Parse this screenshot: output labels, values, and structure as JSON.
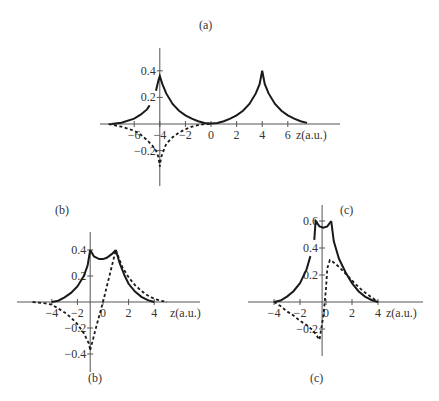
{
  "figure": {
    "panel_labels_top": [
      "(a)",
      "(b)",
      "(c)"
    ],
    "panel_labels_bottom": [
      "(b)",
      "(c)"
    ],
    "caption_fragment": ""
  },
  "chart_data": [
    {
      "id": "a",
      "type": "line",
      "title": "(a)",
      "xlabel": "z(a.u.)",
      "ylabel": "",
      "xlim": [
        -8,
        8
      ],
      "ylim": [
        -0.32,
        0.45
      ],
      "xticks": [
        -6,
        -4,
        -2,
        0,
        2,
        4,
        6
      ],
      "xtick_labels": [
        "-6",
        "-4",
        "-2",
        "0",
        "2",
        "4",
        "6"
      ],
      "yticks": [
        0.4,
        0.2,
        -0.2
      ],
      "ytick_labels": [
        "0.4",
        "0.2",
        "-0.2"
      ],
      "yaxis_at_x": -4,
      "grid": false,
      "legend": null,
      "series": [
        {
          "name": "solid",
          "style": "solid",
          "segments": [
            {
              "x": [
                -7.8,
                -7,
                -6,
                -5.5,
                -5,
                -4.8
              ],
              "y": [
                0.0,
                0.01,
                0.04,
                0.07,
                0.11,
                0.14
              ]
            },
            {
              "x": [
                -4.3,
                -4.1,
                -4,
                -3.8,
                -3.5,
                -3,
                -2.5,
                -2,
                -1.5,
                -1,
                -0.5,
                0,
                0.5,
                1,
                1.5,
                2,
                2.5,
                3,
                3.5,
                3.8,
                4,
                4.2,
                4.5,
                5,
                5.5,
                6,
                6.5,
                7,
                7.5
              ],
              "y": [
                0.25,
                0.33,
                0.36,
                0.3,
                0.23,
                0.15,
                0.1,
                0.065,
                0.04,
                0.02,
                0.008,
                0.003,
                0.008,
                0.02,
                0.04,
                0.065,
                0.1,
                0.15,
                0.23,
                0.3,
                0.4,
                0.3,
                0.23,
                0.15,
                0.1,
                0.065,
                0.04,
                0.02,
                0.008
              ]
            }
          ]
        },
        {
          "name": "dashed",
          "style": "dashed",
          "segments": [
            {
              "x": [
                -8,
                -7,
                -6,
                -5.5,
                -5,
                -4.6,
                -4.3,
                -4.1,
                -4,
                -3.9,
                -3.7,
                -3.5,
                -3,
                -2.5,
                -2,
                -1.5,
                -1,
                -0.5,
                0
              ],
              "y": [
                0.0,
                -0.02,
                -0.05,
                -0.08,
                -0.12,
                -0.16,
                -0.2,
                -0.25,
                -0.32,
                -0.25,
                -0.2,
                -0.15,
                -0.1,
                -0.065,
                -0.04,
                -0.02,
                -0.008,
                0.0,
                0.0
              ]
            }
          ]
        }
      ]
    },
    {
      "id": "b",
      "type": "line",
      "title": "(b)",
      "xlabel": "z(a.u.)",
      "ylabel": "",
      "xlim": [
        -5.5,
        5.5
      ],
      "ylim": [
        -0.45,
        0.45
      ],
      "xticks": [
        -4,
        -2,
        0,
        2,
        4
      ],
      "xtick_labels": [
        "-4",
        "-2",
        "0",
        "2",
        "4"
      ],
      "yticks": [
        0.4,
        0.2,
        -0.2,
        -0.4
      ],
      "ytick_labels": [
        "0.4",
        "0.2",
        "-0.2",
        "-0.4"
      ],
      "yaxis_at_x": -1,
      "grid": false,
      "legend": null,
      "series": [
        {
          "name": "solid",
          "style": "solid",
          "segments": [
            {
              "x": [
                -4,
                -3.5,
                -3,
                -2.5,
                -2,
                -1.5,
                -1.2,
                -1
              ],
              "y": [
                0.0,
                0.01,
                0.035,
                0.07,
                0.12,
                0.2,
                0.28,
                0.4
              ]
            },
            {
              "x": [
                -1,
                -0.7,
                -0.3,
                0,
                0.3,
                0.7,
                1
              ],
              "y": [
                0.4,
                0.35,
                0.33,
                0.33,
                0.34,
                0.37,
                0.4
              ]
            },
            {
              "x": [
                1,
                1.3,
                1.7,
                2,
                2.5,
                3,
                3.5,
                4
              ],
              "y": [
                0.4,
                0.3,
                0.2,
                0.14,
                0.08,
                0.04,
                0.015,
                0.0
              ]
            }
          ]
        },
        {
          "name": "dashed",
          "style": "dashed",
          "segments": [
            {
              "x": [
                -5.5,
                -4.5,
                -4,
                -3.5,
                -3,
                -2.5,
                -2,
                -1.5,
                -1.1,
                -1
              ],
              "y": [
                0.0,
                -0.01,
                -0.02,
                -0.05,
                -0.08,
                -0.12,
                -0.17,
                -0.24,
                -0.32,
                -0.37
              ]
            },
            {
              "x": [
                -1,
                -0.5,
                0,
                0.5,
                1
              ],
              "y": [
                -0.37,
                -0.18,
                0.0,
                0.2,
                0.4
              ]
            },
            {
              "x": [
                1,
                1.5,
                2,
                2.5,
                3,
                3.5,
                4,
                4.5,
                5
              ],
              "y": [
                0.4,
                0.27,
                0.19,
                0.13,
                0.085,
                0.05,
                0.025,
                0.01,
                0.0
              ]
            }
          ]
        }
      ]
    },
    {
      "id": "c",
      "type": "line",
      "title": "(c)",
      "xlabel": "z(a.u.)",
      "ylabel": "",
      "xlim": [
        -5,
        5
      ],
      "ylim": [
        -0.35,
        0.65
      ],
      "xticks": [
        -4,
        -2,
        0,
        2,
        4
      ],
      "xtick_labels": [
        "-4",
        "-2",
        "0",
        "2",
        "4"
      ],
      "yticks": [
        0.6,
        0.4,
        0.2,
        -0.2
      ],
      "ytick_labels": [
        "0.6",
        "0.4",
        "0.2",
        "-0.2"
      ],
      "yaxis_at_x": -0.3,
      "grid": false,
      "legend": null,
      "series": [
        {
          "name": "solid",
          "style": "solid",
          "segments": [
            {
              "x": [
                -4,
                -3.5,
                -3,
                -2.5,
                -2,
                -1.5,
                -1.2
              ],
              "y": [
                0.0,
                0.01,
                0.04,
                0.08,
                0.14,
                0.24,
                0.34
              ]
            },
            {
              "x": [
                -0.9,
                -0.8,
                -0.5,
                -0.2,
                0.1,
                0.4
              ],
              "y": [
                0.46,
                0.6,
                0.56,
                0.55,
                0.56,
                0.6
              ]
            },
            {
              "x": [
                0.4,
                0.6,
                1,
                1.5,
                2,
                2.5,
                3,
                3.5,
                4
              ],
              "y": [
                0.6,
                0.45,
                0.32,
                0.22,
                0.14,
                0.08,
                0.04,
                0.015,
                0.0
              ]
            }
          ]
        },
        {
          "name": "dashed",
          "style": "dashed",
          "segments": [
            {
              "x": [
                -4,
                -3.5,
                -3,
                -2.5,
                -2,
                -1.5,
                -1,
                -0.5,
                -0.2,
                0,
                0.1,
                0.3,
                0.5,
                1,
                1.5,
                2,
                2.5,
                3,
                3.5,
                4
              ],
              "y": [
                0.0,
                -0.03,
                -0.07,
                -0.1,
                -0.14,
                -0.17,
                -0.21,
                -0.28,
                -0.1,
                0.1,
                0.25,
                0.31,
                0.3,
                0.26,
                0.21,
                0.16,
                0.11,
                0.07,
                0.035,
                0.0
              ]
            }
          ]
        }
      ]
    }
  ]
}
